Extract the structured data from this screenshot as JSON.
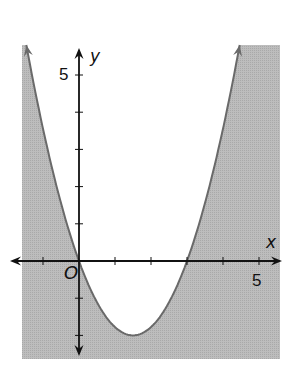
{
  "chart_data": {
    "type": "area",
    "title": "",
    "xlabel": "x",
    "ylabel": "y",
    "origin_label": "O",
    "x_tick_label": "5",
    "y_tick_label": "5",
    "xlim": [
      -1.5,
      5.7
    ],
    "ylim": [
      -2.6,
      5.8
    ],
    "x_ticks": [
      -1,
      0,
      1,
      2,
      3,
      4,
      5
    ],
    "y_ticks": [
      -2,
      -1,
      0,
      1,
      2,
      3,
      4,
      5
    ],
    "grid": false,
    "curve": {
      "kind": "parabola",
      "equation_approx": "y = 0.89x^2 - 2.67x",
      "vertex": [
        1.5,
        -2
      ],
      "roots": [
        0,
        3
      ],
      "boundary_style": "solid",
      "arrows_at_ends": true
    },
    "shaded_region": "outside the parabola (y below the curve)",
    "colors": {
      "shade": "#b8b8b8",
      "curve": "#6a6a6a",
      "axes": "#111111",
      "background": "#ffffff"
    }
  },
  "labels": {
    "x_axis": "x",
    "y_axis": "y",
    "origin": "O",
    "x_five": "5",
    "y_five": "5"
  }
}
